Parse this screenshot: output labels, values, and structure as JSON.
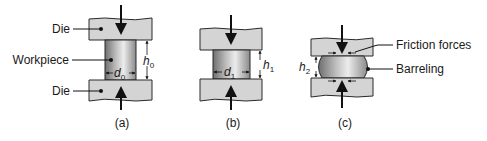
{
  "diagram": {
    "colors": {
      "die_fill": "#d4d4d4",
      "die_stroke": "#2a2a2a",
      "workpiece_dark": "#7a7a7a",
      "workpiece_light": "#e8e8e8",
      "line": "#111111",
      "background": "#ffffff"
    },
    "panels": [
      {
        "id": "a",
        "caption": "(a)",
        "labels": {
          "die_top": "Die",
          "workpiece": "Workpiece",
          "die_bottom": "Die"
        },
        "diameter_symbol": "d",
        "diameter_subscript": "0",
        "height_symbol": "h",
        "height_subscript": "0"
      },
      {
        "id": "b",
        "caption": "(b)",
        "diameter_symbol": "d",
        "diameter_subscript": "1",
        "height_symbol": "h",
        "height_subscript": "1"
      },
      {
        "id": "c",
        "caption": "(c)",
        "height_symbol": "h",
        "height_subscript": "2",
        "labels": {
          "friction": "Friction forces",
          "barreling": "Barreling"
        }
      }
    ]
  }
}
